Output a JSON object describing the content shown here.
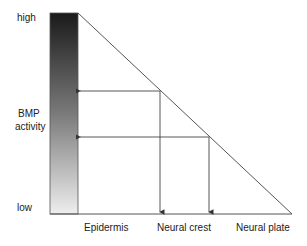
{
  "diagram": {
    "axis": {
      "high_label": "high",
      "mid_label_line1": "BMP",
      "mid_label_line2": "activity",
      "low_label": "low"
    },
    "categories": [
      "Epidermis",
      "Neural crest",
      "Neural plate"
    ],
    "colors": {
      "line": "#555555",
      "gradient_top": "#1a1a1a",
      "gradient_bottom": "#ededed"
    }
  }
}
